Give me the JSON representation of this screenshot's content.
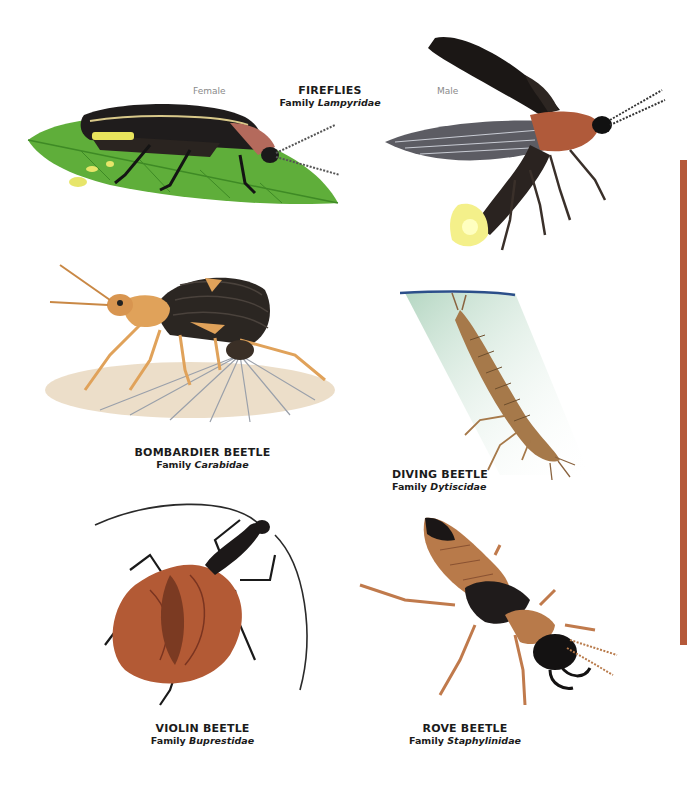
{
  "page": {
    "accent_color": "#b5593a"
  },
  "fireflies": {
    "title": "FIREFLIES",
    "family_prefix": "Family",
    "family_name": "Lampyridae",
    "female_label": "Female",
    "male_label": "Male"
  },
  "species": [
    {
      "name": "BOMBARDIER BEETLE",
      "family_prefix": "Family",
      "family_name": "Carabidae"
    },
    {
      "name": "DIVING BEETLE",
      "family_prefix": "Family",
      "family_name": "Dytiscidae"
    },
    {
      "name": "VIOLIN BEETLE",
      "family_prefix": "Family",
      "family_name": "Buprestidae"
    },
    {
      "name": "ROVE BEETLE",
      "family_prefix": "Family",
      "family_name": "Staphylinidae"
    }
  ],
  "illustrations": [
    {
      "id": "firefly-female",
      "icon": "firefly-on-leaf-icon"
    },
    {
      "id": "firefly-male",
      "icon": "firefly-flying-icon"
    },
    {
      "id": "bombardier-beetle",
      "icon": "bombardier-beetle-icon"
    },
    {
      "id": "diving-beetle",
      "icon": "diving-beetle-larva-icon"
    },
    {
      "id": "violin-beetle",
      "icon": "violin-beetle-icon"
    },
    {
      "id": "rove-beetle",
      "icon": "rove-beetle-icon"
    }
  ]
}
